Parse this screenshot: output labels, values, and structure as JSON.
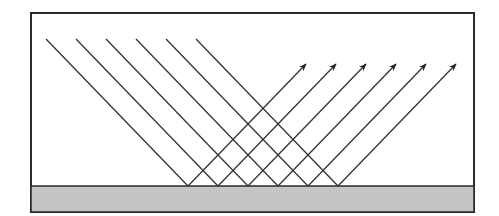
{
  "diagram": {
    "canvas": {
      "width": 499,
      "height": 216,
      "background": "#ffffff"
    },
    "frame": {
      "x": 31,
      "y": 13,
      "width": 443,
      "height": 199,
      "stroke": "#2a2a2a",
      "stroke_width": 2
    },
    "surface": {
      "x": 31,
      "y": 186,
      "width": 443,
      "height": 26,
      "fill": "#c4c4c4",
      "stroke": "#2a2a2a",
      "label": "reflecting-surface"
    },
    "ray_color": "#333333",
    "rays": [
      {
        "start": [
          46,
          39
        ],
        "reflect": [
          188,
          186
        ],
        "tip": [
          306,
          64
        ]
      },
      {
        "start": [
          76,
          39
        ],
        "reflect": [
          218,
          186
        ],
        "tip": [
          336,
          64
        ]
      },
      {
        "start": [
          106,
          39
        ],
        "reflect": [
          248,
          186
        ],
        "tip": [
          366,
          64
        ]
      },
      {
        "start": [
          136,
          39
        ],
        "reflect": [
          278,
          186
        ],
        "tip": [
          396,
          64
        ]
      },
      {
        "start": [
          166,
          39
        ],
        "reflect": [
          308,
          186
        ],
        "tip": [
          426,
          64
        ]
      },
      {
        "start": [
          196,
          39
        ],
        "reflect": [
          338,
          186
        ],
        "tip": [
          456,
          64
        ]
      }
    ],
    "incident_angle_deg": 45,
    "reflected_angle_deg": 45
  }
}
